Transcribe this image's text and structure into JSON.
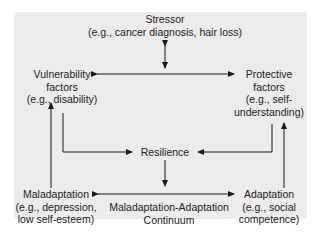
{
  "diagram": {
    "stressor": {
      "title": "Stressor",
      "example": "(e.g., cancer diagnosis, hair loss)"
    },
    "vulnerability": {
      "line1": "Vulnerability",
      "line2": "factors",
      "line3": "(e.g., disability)"
    },
    "protective": {
      "line1": "Protective",
      "line2": "factors",
      "line3": "(e.g., self-",
      "line4": "understanding)"
    },
    "resilience": {
      "title": "Resilience"
    },
    "maladaptation": {
      "line1": "Maladaptation",
      "line2": "(e.g., depression,",
      "line3": "low self-esteem)"
    },
    "adaptation": {
      "line1": "Adaptation",
      "line2": "(e.g., social",
      "line3": "competence)"
    },
    "continuum": {
      "line1": "Maladaptation-Adaptation",
      "line2": "Continuum"
    }
  }
}
